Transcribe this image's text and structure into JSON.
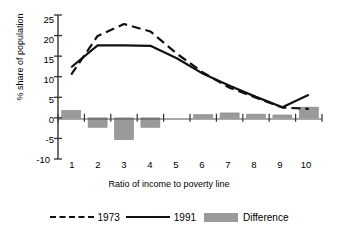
{
  "chart_data": {
    "type": "bar",
    "title": "",
    "xlabel": "Ratio of income to poverty line",
    "ylabel": "% share of population",
    "categories": [
      "1",
      "2",
      "3",
      "4",
      "5",
      "6",
      "7",
      "8",
      "9",
      "10"
    ],
    "x": [
      1,
      2,
      3,
      4,
      5,
      6,
      7,
      8,
      9,
      10
    ],
    "ylim": [
      -10,
      25
    ],
    "yticks": [
      25,
      20,
      15,
      10,
      5,
      0,
      -5,
      -10
    ],
    "ytick_labels": [
      "25",
      "20",
      "15",
      "10",
      "5",
      "0",
      "-5",
      "-10"
    ],
    "xticks": [
      1,
      2,
      3,
      4,
      5,
      6,
      7,
      8,
      9,
      10
    ],
    "grid": false,
    "legend_position": "bottom",
    "series": [
      {
        "name": "1973",
        "type": "line",
        "style": "dashed",
        "color": "#111111",
        "values": [
          10.5,
          19.9,
          22.8,
          21.0,
          15.6,
          11.0,
          7.3,
          4.9,
          2.5,
          2.2
        ]
      },
      {
        "name": "1991",
        "type": "line",
        "style": "solid",
        "color": "#111111",
        "values": [
          12.3,
          17.6,
          17.6,
          17.5,
          14.5,
          10.7,
          7.8,
          5.1,
          2.6,
          5.6
        ]
      },
      {
        "name": "Difference",
        "type": "bar",
        "color": "#9a9a9a",
        "values": [
          1.8,
          -2.3,
          -5.3,
          -2.3,
          0.0,
          0.8,
          1.2,
          0.9,
          0.7,
          2.6
        ]
      }
    ]
  },
  "axes": {
    "y_label": "% share of population",
    "x_label": "Ratio of income to poverty line"
  },
  "legend": {
    "items": [
      {
        "label": "1973",
        "marker": "dashed-line"
      },
      {
        "label": "1991",
        "marker": "solid-line"
      },
      {
        "label": "Difference",
        "marker": "gray-swatch"
      }
    ]
  },
  "colors": {
    "bar": "#9a9a9a",
    "line": "#111111",
    "axis": "#333333",
    "background": "#ffffff"
  }
}
